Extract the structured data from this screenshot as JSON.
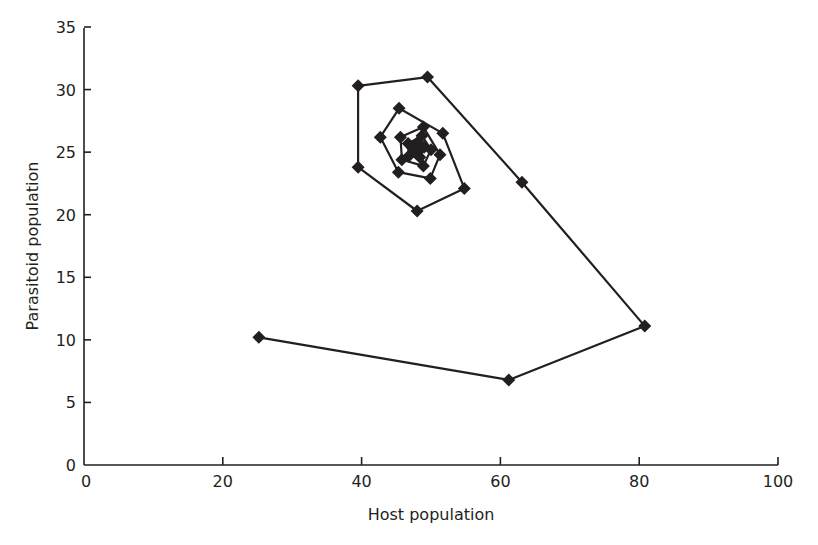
{
  "chart_data": {
    "type": "line",
    "title": "",
    "xlabel": "Host population",
    "ylabel": "Parasitoid population",
    "xlim": [
      0,
      100
    ],
    "ylim": [
      0,
      35
    ],
    "x_ticks": [
      0,
      20,
      40,
      60,
      80,
      100
    ],
    "y_ticks": [
      0,
      5,
      10,
      15,
      20,
      25,
      30,
      35
    ],
    "grid": false,
    "legend": null,
    "marker": "diamond",
    "series": [
      {
        "name": "Host-parasitoid trajectory",
        "points": [
          {
            "x": 25.2,
            "y": 10.2
          },
          {
            "x": 61.2,
            "y": 6.8
          },
          {
            "x": 80.8,
            "y": 11.1
          },
          {
            "x": 63.1,
            "y": 22.6
          },
          {
            "x": 49.5,
            "y": 31.0
          },
          {
            "x": 39.5,
            "y": 30.3
          },
          {
            "x": 39.5,
            "y": 23.8
          },
          {
            "x": 48.0,
            "y": 20.3
          },
          {
            "x": 54.8,
            "y": 22.1
          },
          {
            "x": 51.7,
            "y": 26.5
          },
          {
            "x": 45.4,
            "y": 28.5
          },
          {
            "x": 42.7,
            "y": 26.2
          },
          {
            "x": 45.3,
            "y": 23.4
          },
          {
            "x": 49.9,
            "y": 22.9
          },
          {
            "x": 51.3,
            "y": 24.8
          },
          {
            "x": 48.9,
            "y": 27.0
          },
          {
            "x": 45.6,
            "y": 26.2
          },
          {
            "x": 45.8,
            "y": 24.4
          },
          {
            "x": 48.9,
            "y": 23.9
          },
          {
            "x": 50.0,
            "y": 25.2
          },
          {
            "x": 48.7,
            "y": 26.3
          },
          {
            "x": 46.7,
            "y": 25.7
          },
          {
            "x": 46.8,
            "y": 24.7
          },
          {
            "x": 48.4,
            "y": 24.6
          },
          {
            "x": 49.0,
            "y": 25.4
          },
          {
            "x": 48.1,
            "y": 25.8
          },
          {
            "x": 47.4,
            "y": 25.3
          },
          {
            "x": 47.9,
            "y": 24.9
          },
          {
            "x": 48.3,
            "y": 25.2
          }
        ]
      }
    ]
  },
  "axes": {
    "x_title": "Host population",
    "y_title": "Parasitoid population",
    "x_tick_labels": [
      "0",
      "20",
      "40",
      "60",
      "80",
      "100"
    ],
    "y_tick_labels": [
      "0",
      "5",
      "10",
      "15",
      "20",
      "25",
      "30",
      "35"
    ]
  }
}
